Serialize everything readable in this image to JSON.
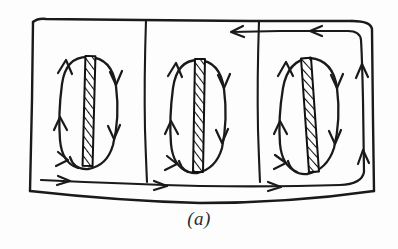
{
  "figure": {
    "caption": "(a)",
    "kind": "hand-drawn-schematic",
    "colors": {
      "ink": "#1a1a1a",
      "background": "#fdfdfd",
      "hatch": "#111111"
    },
    "outer_box": {
      "name": "duct-outline",
      "corner_radius_px": 6,
      "stroke_width_px": 2.2
    },
    "dividers": [
      {
        "name": "divider-1",
        "x": 146
      },
      {
        "name": "divider-2",
        "x": 259
      }
    ],
    "cells": [
      {
        "name": "cell-1",
        "rod_label": "hatched-rod-1",
        "center_x": 92,
        "center_y": 113,
        "loop_rx": 32,
        "loop_ry": 56,
        "tilt_deg": 3,
        "arrow_count": 6
      },
      {
        "name": "cell-2",
        "rod_label": "hatched-rod-2",
        "center_x": 199,
        "center_y": 117,
        "loop_rx": 30,
        "loop_ry": 58,
        "tilt_deg": 2,
        "arrow_count": 6
      },
      {
        "name": "cell-3",
        "rod_label": "hatched-rod-3",
        "center_x": 308,
        "center_y": 117,
        "loop_rx": 32,
        "loop_ry": 57,
        "tilt_deg": -5,
        "arrow_count": 6
      }
    ],
    "flow_paths": {
      "bottom_inflow": {
        "name": "bottom-inflow-line",
        "direction": "rightward",
        "arrow_positions_x": [
          62,
          158,
          272
        ],
        "y": 180
      },
      "top_return": {
        "name": "top-return-line",
        "direction": "leftward",
        "arrow_positions_x": [
          237,
          318
        ],
        "y": 32
      },
      "right_riser": {
        "name": "right-riser-line",
        "direction": "upward",
        "x": 362,
        "arrow_positions_y": [
          152,
          66
        ]
      }
    }
  }
}
